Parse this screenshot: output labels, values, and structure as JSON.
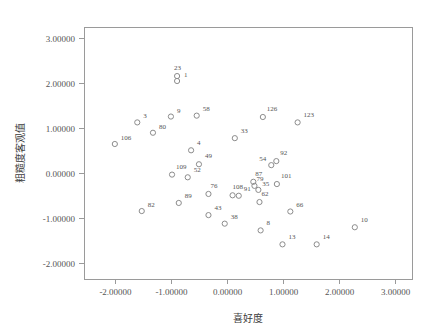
{
  "chart_data": {
    "type": "scatter",
    "title": "",
    "xlabel": "喜好度",
    "ylabel": "粗糙度客观值",
    "xlim": [
      -2.55,
      3.3
    ],
    "ylim": [
      -2.35,
      3.25
    ],
    "grid": false,
    "legend": null,
    "xticks": [
      -2,
      -1,
      0,
      1,
      2,
      3
    ],
    "yticks": [
      -2,
      -1,
      0,
      1,
      2,
      3
    ],
    "xtick_labels": [
      "-2.00000",
      "-1.00000",
      "0.00000",
      "1.00000",
      "2.00000",
      "3.00000"
    ],
    "ytick_labels": [
      "-2.00000",
      "-1.00000",
      "0.00000",
      "1.00000",
      "2.00000",
      "3.00000"
    ],
    "marker": "open-circle",
    "marker_color": "#8c8c8c",
    "points": [
      {
        "label": "106",
        "x": -2.0,
        "y": 0.65,
        "lx": 6,
        "ly": -4
      },
      {
        "label": "82",
        "x": -1.52,
        "y": -0.84,
        "lx": 6,
        "ly": -4
      },
      {
        "label": "3",
        "x": -1.6,
        "y": 1.13,
        "lx": 6,
        "ly": -4
      },
      {
        "label": "80",
        "x": -1.32,
        "y": 0.9,
        "lx": 6,
        "ly": -4
      },
      {
        "label": "9",
        "x": -1.0,
        "y": 1.26,
        "lx": 6,
        "ly": -4
      },
      {
        "label": "23",
        "x": -0.89,
        "y": 2.16,
        "lx": -3,
        "ly": -6
      },
      {
        "label": "1",
        "x": -0.89,
        "y": 2.05,
        "lx": 7,
        "ly": -4
      },
      {
        "label": "109",
        "x": -0.98,
        "y": -0.03,
        "lx": 4,
        "ly": -6
      },
      {
        "label": "89",
        "x": -0.86,
        "y": -0.66,
        "lx": 6,
        "ly": -5
      },
      {
        "label": "52",
        "x": -0.7,
        "y": -0.09,
        "lx": 6,
        "ly": -5
      },
      {
        "label": "4",
        "x": -0.64,
        "y": 0.51,
        "lx": 6,
        "ly": -5
      },
      {
        "label": "58",
        "x": -0.54,
        "y": 1.28,
        "lx": 6,
        "ly": -5
      },
      {
        "label": "49",
        "x": -0.5,
        "y": 0.2,
        "lx": 6,
        "ly": -6
      },
      {
        "label": "43",
        "x": -0.33,
        "y": -0.93,
        "lx": 6,
        "ly": -5
      },
      {
        "label": "76",
        "x": -0.33,
        "y": -0.46,
        "lx": 2,
        "ly": -6
      },
      {
        "label": "38",
        "x": -0.04,
        "y": -1.12,
        "lx": 6,
        "ly": -5
      },
      {
        "label": "108",
        "x": 0.1,
        "y": -0.49,
        "lx": 0,
        "ly": -6
      },
      {
        "label": "33",
        "x": 0.14,
        "y": 0.78,
        "lx": 6,
        "ly": -5
      },
      {
        "label": "91",
        "x": 0.21,
        "y": -0.5,
        "lx": 5,
        "ly": -5
      },
      {
        "label": "87",
        "x": 0.47,
        "y": -0.19,
        "lx": 2,
        "ly": -6
      },
      {
        "label": "79",
        "x": 0.49,
        "y": -0.28,
        "lx": 2,
        "ly": -5
      },
      {
        "label": "35",
        "x": 0.56,
        "y": -0.37,
        "lx": 4,
        "ly": -4
      },
      {
        "label": "62",
        "x": 0.58,
        "y": -0.64,
        "lx": 2,
        "ly": -6
      },
      {
        "label": "8",
        "x": 0.6,
        "y": -1.27,
        "lx": 6,
        "ly": -5
      },
      {
        "label": "126",
        "x": 0.64,
        "y": 1.25,
        "lx": 4,
        "ly": -6
      },
      {
        "label": "54",
        "x": 0.79,
        "y": 0.18,
        "lx": -12,
        "ly": -4
      },
      {
        "label": "92",
        "x": 0.88,
        "y": 0.27,
        "lx": 4,
        "ly": -6
      },
      {
        "label": "101",
        "x": 0.89,
        "y": -0.24,
        "lx": 4,
        "ly": -6
      },
      {
        "label": "13",
        "x": 0.99,
        "y": -1.58,
        "lx": 6,
        "ly": -5
      },
      {
        "label": "66",
        "x": 1.13,
        "y": -0.85,
        "lx": 6,
        "ly": -5
      },
      {
        "label": "123",
        "x": 1.26,
        "y": 1.13,
        "lx": 6,
        "ly": -5
      },
      {
        "label": "14",
        "x": 1.6,
        "y": -1.58,
        "lx": 6,
        "ly": -5
      },
      {
        "label": "10",
        "x": 2.28,
        "y": -1.2,
        "lx": 6,
        "ly": -5
      }
    ]
  },
  "axes": {
    "x_title": "喜好度",
    "y_title": "粗糙度客观值"
  }
}
